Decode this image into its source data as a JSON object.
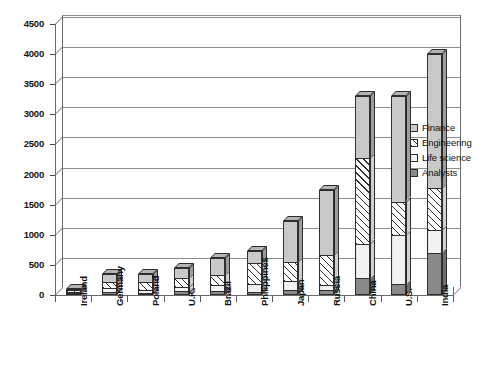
{
  "chart_data": {
    "type": "bar",
    "subtype": "stacked-3d-column",
    "title": "",
    "xlabel": "",
    "ylabel": "",
    "ylim": [
      0,
      4500
    ],
    "ytick_step": 500,
    "ytick_labels": [
      "0",
      "500",
      "1000",
      "1500",
      "2000",
      "2500",
      "3000",
      "3500",
      "4000",
      "4500"
    ],
    "ytick_values": [
      0,
      500,
      1000,
      1500,
      2000,
      2500,
      3000,
      3500,
      4000,
      4500
    ],
    "grid": true,
    "legend_position": "right",
    "categories": [
      "Ireland",
      "Germany",
      "Poland",
      "U.K.",
      "Brazil",
      "Philippines",
      "Japan",
      "Russia",
      "China",
      "U.S.",
      "India"
    ],
    "series": [
      {
        "name": "Analysts",
        "pattern": "solid-dark-gray",
        "color": "#8a8a8a",
        "values": [
          25,
          50,
          40,
          60,
          60,
          50,
          75,
          90,
          275,
          175,
          700
        ]
      },
      {
        "name": "Life science",
        "pattern": "light-vertical-lines",
        "color": "#f2f2f2",
        "values": [
          25,
          60,
          50,
          75,
          100,
          125,
          150,
          75,
          575,
          825,
          375
        ]
      },
      {
        "name": "Engineering",
        "pattern": "diagonal-hatch",
        "color": "#ffffff",
        "values": [
          25,
          110,
          130,
          150,
          180,
          350,
          325,
          500,
          1425,
          550,
          700
        ]
      },
      {
        "name": "Finance",
        "pattern": "solid-light-gray",
        "color": "#c9c9c9",
        "values": [
          25,
          130,
          130,
          165,
          275,
          200,
          675,
          1085,
          1025,
          1750,
          2225
        ]
      }
    ],
    "totals": [
      100,
      350,
      350,
      450,
      615,
      725,
      1225,
      1750,
      3300,
      3300,
      4000
    ],
    "legend_entries": [
      "Finance",
      "Engineering",
      "Life science",
      "Analysts"
    ]
  }
}
